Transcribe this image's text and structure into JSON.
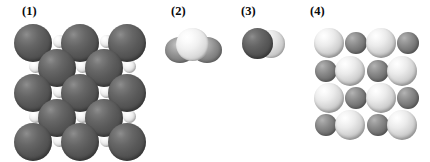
{
  "figure": {
    "background_color": "#ffffff",
    "width": 430,
    "height": 162,
    "kind": "space-filling molecular and crystal lattice models"
  },
  "panels": [
    {
      "label": "(1)",
      "name": "ionic-lattice-dark",
      "description": "two-dimensional ionic crystal lattice of large dark spheres with small light spheres in the interstitial sites",
      "large_sphere_color": "#5a5a5a",
      "small_sphere_color": "#f0f0f0",
      "large_sphere_count": 13,
      "small_sphere_count": 12
    },
    {
      "label": "(2)",
      "name": "triatomic-molecule",
      "description": "space-filling model of a bent triatomic molecule, a large light central sphere flanked by two darker lobes",
      "center_sphere_color": "#e8e8e8",
      "lobe_sphere_color": "#8e8e8e",
      "atom_count": 3
    },
    {
      "label": "(3)",
      "name": "diatomic-molecule",
      "description": "space-filling model of a diatomic molecule, one dark sphere overlapping one lighter sphere",
      "left_sphere_color": "#5a5a5a",
      "right_sphere_color": "#d8d8d8",
      "atom_count": 2
    },
    {
      "label": "(4)",
      "name": "ionic-lattice-checkerboard",
      "description": "two-dimensional ionic crystal lattice with alternating large pale spheres and smaller mid-gray spheres in a checkerboard arrangement",
      "large_sphere_color": "#e0e0e0",
      "small_sphere_color": "#808080",
      "rows": 4,
      "columns": 4
    }
  ]
}
